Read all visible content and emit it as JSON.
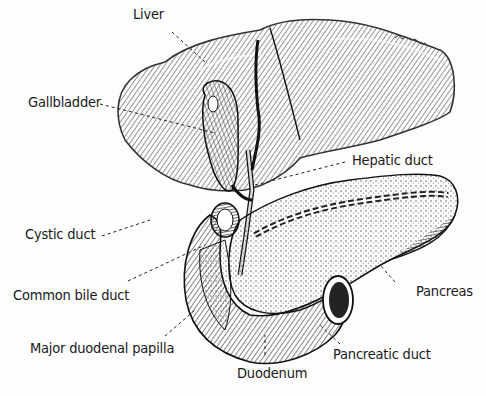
{
  "diagram": {
    "signature": "illustrator signature",
    "labels": [
      {
        "id": "liver",
        "text": "Liver"
      },
      {
        "id": "gallbladder",
        "text": "Gallbladder"
      },
      {
        "id": "hepatic-duct",
        "text": "Hepatic duct"
      },
      {
        "id": "cystic-duct",
        "text": "Cystic duct"
      },
      {
        "id": "common-bile-duct",
        "text": "Common bile duct"
      },
      {
        "id": "pancreas",
        "text": "Pancreas"
      },
      {
        "id": "major-duodenal-papilla",
        "text": "Major duodenal papilla"
      },
      {
        "id": "pancreatic-duct",
        "text": "Pancreatic duct"
      },
      {
        "id": "duodenum",
        "text": "Duodenum"
      }
    ]
  }
}
